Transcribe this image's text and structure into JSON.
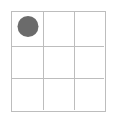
{
  "canvas": {
    "width": 116,
    "height": 122,
    "background_color": "#ffffff"
  },
  "grid": {
    "label": "3x3 grid",
    "rows": 3,
    "columns": 3,
    "left": 11,
    "top": 11,
    "width": 95,
    "height": 101,
    "line_color": "#bdbdbd",
    "line_width": 1,
    "border_color": "#bdbdbd",
    "border_width": 1,
    "cell_fill": "#ffffff",
    "column_dividers_x": [
      43,
      75
    ],
    "row_dividers_y": [
      46,
      79
    ]
  },
  "piece": {
    "shape": "circle",
    "color": "#6b6b6b",
    "diameter": 21,
    "center_x": 27,
    "center_y": 26,
    "row": 1,
    "column": 1,
    "cell_index": 0,
    "label": "circle-piece"
  },
  "cells": [
    {
      "id": "cell-r1c1",
      "row": 1,
      "column": 1,
      "occupied": true,
      "content": "circle"
    },
    {
      "id": "cell-r1c2",
      "row": 1,
      "column": 2,
      "occupied": false,
      "content": ""
    },
    {
      "id": "cell-r1c3",
      "row": 1,
      "column": 3,
      "occupied": false,
      "content": ""
    },
    {
      "id": "cell-r2c1",
      "row": 2,
      "column": 1,
      "occupied": false,
      "content": ""
    },
    {
      "id": "cell-r2c2",
      "row": 2,
      "column": 2,
      "occupied": false,
      "content": ""
    },
    {
      "id": "cell-r2c3",
      "row": 2,
      "column": 3,
      "occupied": false,
      "content": ""
    },
    {
      "id": "cell-r3c1",
      "row": 3,
      "column": 1,
      "occupied": false,
      "content": ""
    },
    {
      "id": "cell-r3c2",
      "row": 3,
      "column": 2,
      "occupied": false,
      "content": ""
    },
    {
      "id": "cell-r3c3",
      "row": 3,
      "column": 3,
      "occupied": false,
      "content": ""
    }
  ]
}
